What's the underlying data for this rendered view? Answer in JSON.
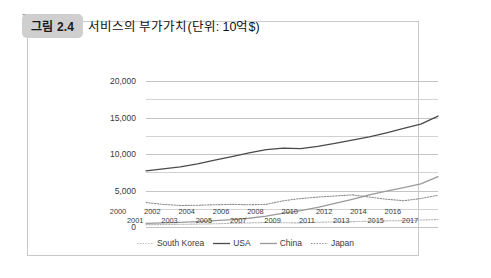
{
  "figure": {
    "badge": "그림 2.4",
    "title": "서비스의 부가가치(단위: 10억$)"
  },
  "colors": {
    "south_korea": "#b8b8b8",
    "usa": "#4a4a4a",
    "china": "#9a9a9a",
    "japan": "#8f8f8f",
    "grid": "#d2d2d2",
    "badge_bg": "#cfcfcf",
    "frame": "#c9c9c9"
  },
  "chart_data": {
    "type": "line",
    "title": "서비스의 부가가치(단위: 10억$)",
    "xlabel": "",
    "ylabel": "",
    "ylim": [
      0,
      20000
    ],
    "yticks": [
      0,
      5000,
      10000,
      15000,
      20000
    ],
    "ytick_labels": [
      "0",
      "5,000",
      "10,000",
      "15,000",
      "20,000"
    ],
    "minor_gridlines": [
      2500,
      7500,
      12500,
      17500
    ],
    "grid": true,
    "legend_position": "bottom",
    "x": [
      2000,
      2001,
      2002,
      2003,
      2004,
      2005,
      2006,
      2007,
      2008,
      2009,
      2010,
      2011,
      2012,
      2013,
      2014,
      2015,
      2016,
      2017
    ],
    "xtick_labels_row1": [
      "2000",
      "2002",
      "2004",
      "2006",
      "2008",
      "2010",
      "2012",
      "2014",
      "2016"
    ],
    "xtick_labels_row2": [
      "2001",
      "2003",
      "2005",
      "2007",
      "2009",
      "2011",
      "2013",
      "2015",
      "2017"
    ],
    "series": [
      {
        "name": "South Korea",
        "style": "dotted",
        "color": "#b8b8b8",
        "values": [
          320,
          330,
          370,
          400,
          440,
          510,
          560,
          620,
          580,
          560,
          650,
          700,
          730,
          790,
          840,
          880,
          950,
          1020
        ]
      },
      {
        "name": "USA",
        "style": "solid",
        "color": "#4a4a4a",
        "values": [
          7700,
          7950,
          8250,
          8650,
          9150,
          9650,
          10150,
          10600,
          10800,
          10750,
          11050,
          11450,
          11900,
          12350,
          12900,
          13500,
          14100,
          15200
        ]
      },
      {
        "name": "China",
        "style": "solid",
        "color": "#9a9a9a",
        "values": [
          500,
          560,
          640,
          730,
          860,
          1000,
          1200,
          1500,
          1900,
          2250,
          2700,
          3250,
          3800,
          4400,
          4900,
          5400,
          5900,
          6900
        ]
      },
      {
        "name": "Japan",
        "style": "dotted",
        "color": "#8f8f8f",
        "values": [
          3350,
          3100,
          2950,
          2980,
          3050,
          3100,
          3050,
          3100,
          3600,
          3900,
          4100,
          4250,
          4400,
          4100,
          3800,
          3600,
          3900,
          4350
        ]
      }
    ]
  },
  "legend": [
    {
      "label": "South Korea",
      "style": "dotted"
    },
    {
      "label": "USA",
      "style": "solid-dark"
    },
    {
      "label": "China",
      "style": "solid-gray"
    },
    {
      "label": "Japan",
      "style": "dotted"
    }
  ]
}
